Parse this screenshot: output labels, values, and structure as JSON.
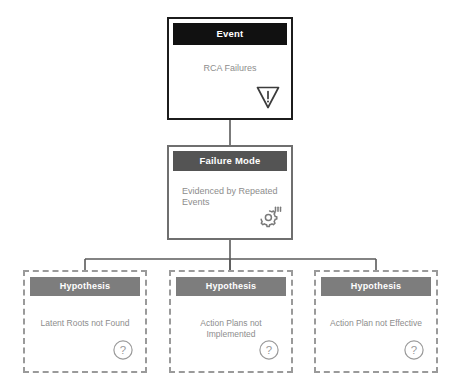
{
  "diagram": {
    "background_color": "#ffffff",
    "width": 459,
    "height": 390
  },
  "colors": {
    "event_header_bg": "#111111",
    "event_border": "#1c1c1c",
    "failure_mode_header_bg": "#545454",
    "failure_mode_border": "#6f6f6f",
    "hypothesis_header_bg": "#7d7d7d",
    "hypothesis_border": "#9a9a9a",
    "header_text": "#ffffff",
    "body_text": "#8d8d8d",
    "connector_line": "#5a5a5a",
    "icon_stroke": "#7a7a7a",
    "event_icon_stroke": "#3c3c3c"
  },
  "nodes": {
    "event": {
      "header": "Event",
      "text": "RCA Failures",
      "icon": "warning-triangle-inverted-icon"
    },
    "failure_mode": {
      "header": "Failure Mode",
      "text": "Evidenced by Repeated Events",
      "icon": "gear-motion-icon"
    },
    "hypotheses": [
      {
        "header": "Hypothesis",
        "text": "Latent Roots not Found",
        "icon": "question-circle-icon"
      },
      {
        "header": "Hypothesis",
        "text": "Action Plans not Implemented",
        "icon": "question-circle-icon"
      },
      {
        "header": "Hypothesis",
        "text": "Action Plan not Effective",
        "icon": "question-circle-icon"
      }
    ]
  },
  "connectors": {
    "event_to_failure_mode": "straight-vertical-line",
    "failure_mode_to_hypotheses": "bus-branch-three-way"
  }
}
